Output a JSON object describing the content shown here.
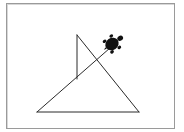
{
  "canvas": {
    "label": "Turtle graphics canvas",
    "background": "#ffffff",
    "border_color": "#9a9a9a",
    "pen_color": "#2a2a2a"
  },
  "drawing": {
    "segments": [
      {
        "from": [
          37,
          112
        ],
        "to": [
          139,
          112
        ]
      },
      {
        "from": [
          139,
          112
        ],
        "to": [
          77,
          35
        ]
      },
      {
        "from": [
          77,
          35
        ],
        "to": [
          77,
          79
        ]
      },
      {
        "from": [
          37,
          112
        ],
        "to": [
          110,
          48
        ]
      }
    ]
  },
  "turtle": {
    "icon": "turtle-icon",
    "position": [
      112,
      44
    ],
    "heading_deg": 35,
    "color": "#111111"
  }
}
